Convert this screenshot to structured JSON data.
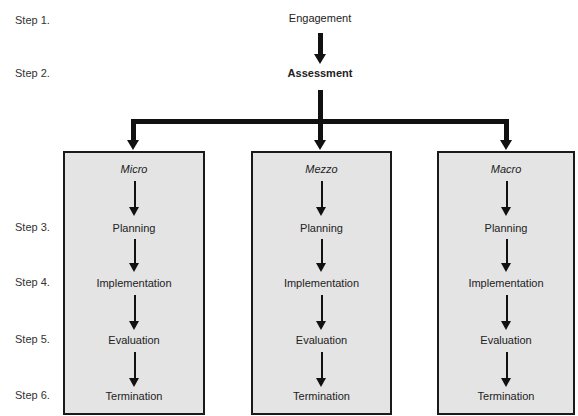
{
  "steps": [
    "Step 1.",
    "Step 2.",
    "Step 3.",
    "Step 4.",
    "Step 5.",
    "Step 6."
  ],
  "top": {
    "engagement": "Engagement",
    "assessment": "Assessment"
  },
  "columns": [
    {
      "title": "Micro",
      "items": [
        "Planning",
        "Implementation",
        "Evaluation",
        "Termination"
      ]
    },
    {
      "title": "Mezzo",
      "items": [
        "Planning",
        "Implementation",
        "Evaluation",
        "Termination"
      ]
    },
    {
      "title": "Macro",
      "items": [
        "Planning",
        "Implementation",
        "Evaluation",
        "Termination"
      ]
    }
  ],
  "colors": {
    "box_fill": "#e4e4e4",
    "line": "#111111"
  }
}
